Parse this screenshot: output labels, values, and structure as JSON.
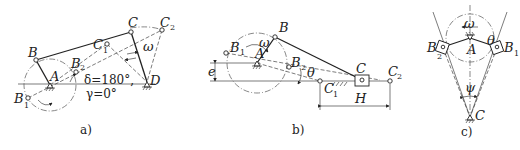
{
  "figures": [
    {
      "id": "a",
      "caption": "a)",
      "title": "Crank-rocker mechanism",
      "labels": {
        "A": "A",
        "B": "B",
        "B1": "B",
        "B1_sub": "1",
        "B2": "B",
        "B2_sub": "2",
        "C": "C",
        "C1": "C",
        "C1_sub": "1",
        "C2": "C",
        "C2_sub": "2",
        "D": "D",
        "omega": "ω",
        "delta": "δ=180°,",
        "gamma": "γ=0°"
      }
    },
    {
      "id": "b",
      "caption": "b)",
      "title": "Offset slider-crank mechanism",
      "labels": {
        "A": "A",
        "B": "B",
        "B1": "B",
        "B1_sub": "1",
        "B2": "B",
        "B2_sub": "2",
        "C": "C",
        "C1": "C",
        "C1_sub": "1",
        "C2": "C",
        "C2_sub": "2",
        "omega": "ω",
        "theta": "θ",
        "e": "e",
        "H": "H"
      }
    },
    {
      "id": "c",
      "caption": "c)",
      "title": "Guide-bar (oscillating slotted lever) mechanism",
      "labels": {
        "A": "A",
        "B1": "B",
        "B1_sub": "1",
        "B2": "B",
        "B2_sub": "2",
        "C": "C",
        "omega": "ω",
        "theta": "θ",
        "psi": "ψ"
      }
    }
  ]
}
